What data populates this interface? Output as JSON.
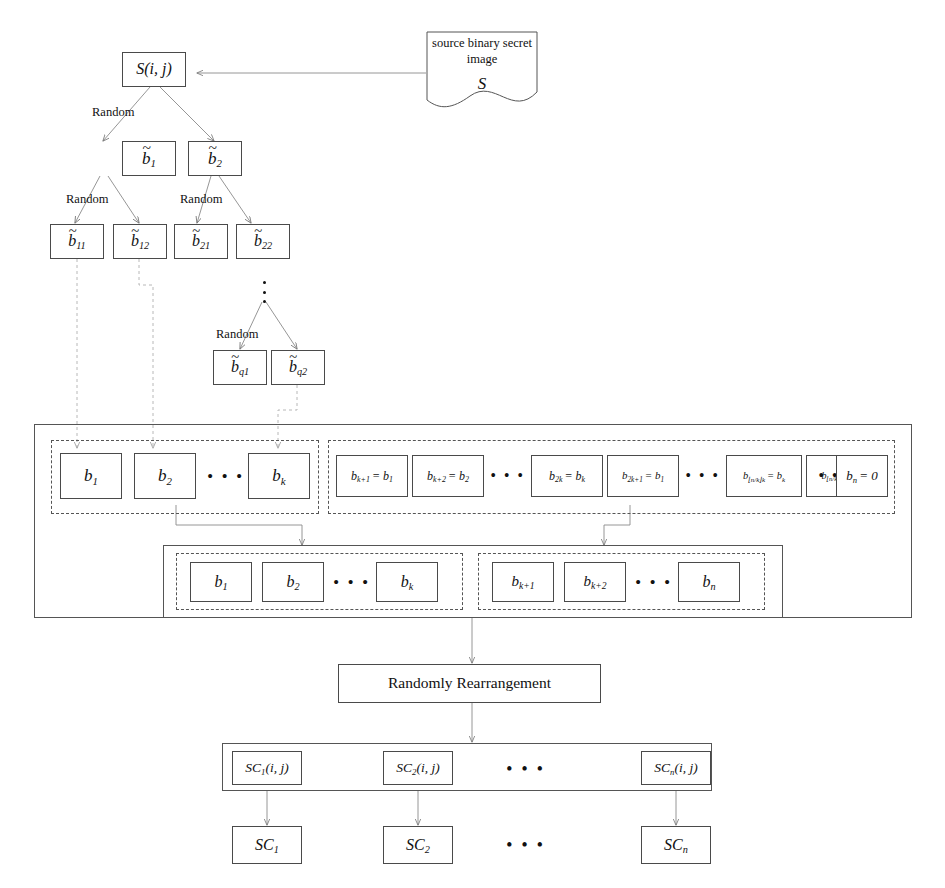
{
  "diagram": {
    "stroke_color": "#555555",
    "text_color": "#111111",
    "background": "#ffffff"
  },
  "source_doc": {
    "line1": "source binary secret",
    "line2": "image",
    "symbol": "S"
  },
  "root": {
    "label": "S(i, j)"
  },
  "random_labels": {
    "l1": "Random",
    "l2": "Random",
    "l3": "Random",
    "l4": "Random"
  },
  "tree_level1": [
    {
      "base": "b",
      "sub": "1",
      "tilde": "~"
    },
    {
      "base": "b",
      "sub": "2",
      "tilde": "~"
    }
  ],
  "tree_level2": [
    {
      "base": "b",
      "sub": "11",
      "tilde": "~"
    },
    {
      "base": "b",
      "sub": "12",
      "tilde": "~"
    },
    {
      "base": "b",
      "sub": "21",
      "tilde": "~"
    },
    {
      "base": "b",
      "sub": "22",
      "tilde": "~"
    }
  ],
  "tree_levelq": [
    {
      "base": "b",
      "sub": "q1",
      "tilde": "~"
    },
    {
      "base": "b",
      "sub": "q2",
      "tilde": "~"
    }
  ],
  "vertical_ellipsis": "⋮",
  "row1_left": {
    "items": [
      {
        "base": "b",
        "sub": "1"
      },
      {
        "base": "b",
        "sub": "2"
      },
      {
        "base": "b",
        "sub": "k"
      }
    ],
    "ellipsis": "• • •"
  },
  "row1_right": {
    "items": [
      {
        "lhs_base": "b",
        "lhs_sub": "k+1",
        "rhs": "= b",
        "rhs_sub": "1"
      },
      {
        "lhs_base": "b",
        "lhs_sub": "k+2",
        "rhs": "= b",
        "rhs_sub": "2"
      },
      {
        "lhs_base": "b",
        "lhs_sub": "2k",
        "rhs": "= b",
        "rhs_sub": "k"
      },
      {
        "lhs_base": "b",
        "lhs_sub": "2k+1",
        "rhs": "= b",
        "rhs_sub": "1"
      },
      {
        "lhs_base": "b",
        "lhs_sub": "⌊n/k⌋k",
        "rhs": "= b",
        "rhs_sub": "k"
      },
      {
        "lhs_base": "b",
        "lhs_sub": "⌊n/k⌋k+1",
        "rhs": "= 0",
        "rhs_sub": ""
      },
      {
        "lhs_base": "b",
        "lhs_sub": "n",
        "rhs": "= 0",
        "rhs_sub": ""
      }
    ],
    "ellipsis1": "• • •",
    "ellipsis2": "• • •",
    "ellipsis3": "• • •"
  },
  "row2_left": {
    "items": [
      {
        "base": "b",
        "sub": "1"
      },
      {
        "base": "b",
        "sub": "2"
      },
      {
        "base": "b",
        "sub": "k"
      }
    ],
    "ellipsis": "• • •"
  },
  "row2_right": {
    "items": [
      {
        "base": "b",
        "sub": "k+1"
      },
      {
        "base": "b",
        "sub": "k+2"
      },
      {
        "base": "b",
        "sub": "n"
      }
    ],
    "ellipsis": "• • •"
  },
  "rearrange": {
    "label": "Randomly Rearrangement"
  },
  "shares_ij": {
    "items": [
      {
        "base": "SC",
        "sub": "1",
        "suffix": "(i, j)"
      },
      {
        "base": "SC",
        "sub": "2",
        "suffix": "(i, j)"
      },
      {
        "base": "SC",
        "sub": "n",
        "suffix": "(i, j)"
      }
    ],
    "ellipsis": "• • •"
  },
  "shares": {
    "items": [
      {
        "base": "SC",
        "sub": "1"
      },
      {
        "base": "SC",
        "sub": "2"
      },
      {
        "base": "SC",
        "sub": "n"
      }
    ],
    "ellipsis": "• • •"
  }
}
